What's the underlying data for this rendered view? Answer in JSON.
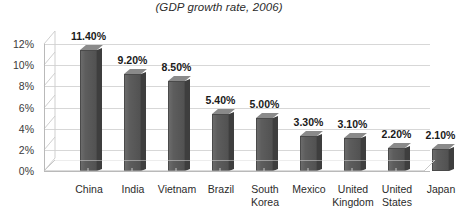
{
  "chart_data": {
    "type": "bar",
    "title": "(GDP growth rate, 2006)",
    "xlabel": "",
    "ylabel": "",
    "ylim": [
      0,
      12
    ],
    "ytick_labels": [
      "12%",
      "10%",
      "8%",
      "6%",
      "4%",
      "2%",
      "0%"
    ],
    "ytick_values": [
      12,
      10,
      8,
      6,
      4,
      2,
      0
    ],
    "grid": true,
    "legend": "none",
    "style": "3d-column",
    "categories": [
      "China",
      "India",
      "Vietnam",
      "Brazil",
      "South\nKorea",
      "Mexico",
      "United\nKingdom",
      "United\nStates",
      "Japan"
    ],
    "values": [
      11.4,
      9.2,
      8.5,
      5.4,
      5.0,
      3.3,
      3.1,
      2.2,
      2.1
    ],
    "data_labels": [
      "11.40%",
      "9.20%",
      "8.50%",
      "5.40%",
      "5.00%",
      "3.30%",
      "3.10%",
      "2.20%",
      "2.10%"
    ],
    "colors": {
      "bar_front": "#5d5d5d",
      "bar_side": "#3e3e3e",
      "bar_top": "#8a8a8a",
      "gridline": "#d7d7d7",
      "axis": "#b9b9b9",
      "text": "#231f20",
      "background": "#ffffff"
    }
  }
}
